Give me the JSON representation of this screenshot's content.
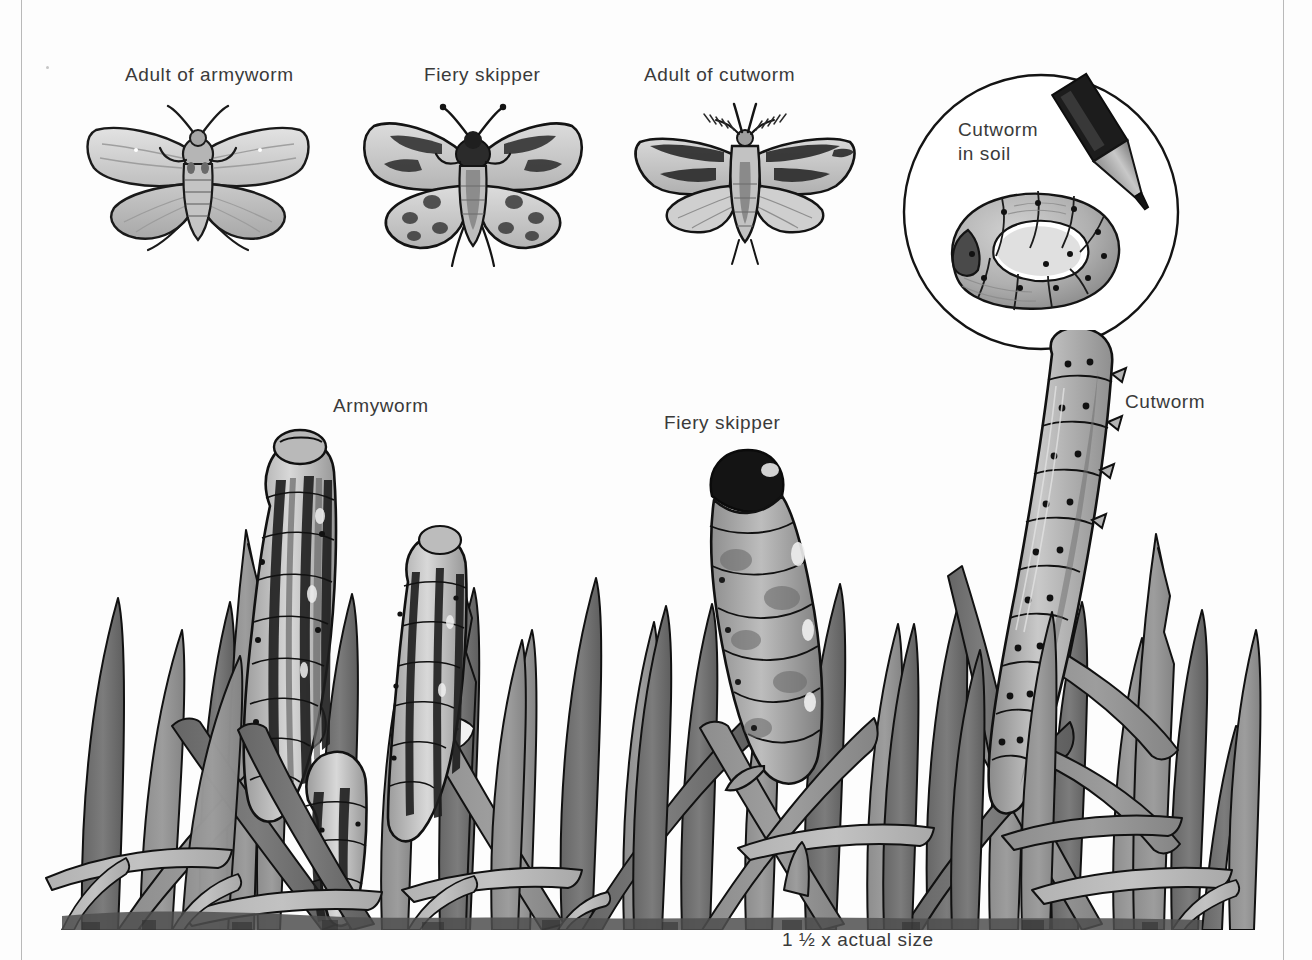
{
  "plate": {
    "title": "Lawn caterpillar pests",
    "background_color": "#fdfdfd",
    "text_color": "#3a3a3a",
    "rule_color": "#b9b9b9",
    "ink_color": "#111111",
    "grass_tone_dark": "#6f6f6f",
    "grass_tone_mid": "#8d8d8d",
    "grass_tone_light": "#b3b3b3",
    "grass_tone_pale": "#d2d2d2"
  },
  "adults": {
    "armyworm": {
      "label": "Adult of armyworm"
    },
    "fiery_skipper": {
      "label": "Fiery skipper"
    },
    "cutworm": {
      "label": "Adult of cutworm"
    }
  },
  "inset": {
    "label": "Cutworm\nin soil",
    "label_line_1": "Cutworm",
    "label_line_2": "in soil"
  },
  "larvae": {
    "armyworm": {
      "label": "Armyworm"
    },
    "fiery_skipper": {
      "label": "Fiery skipper"
    },
    "cutworm": {
      "label": "Cutworm"
    }
  },
  "caption": {
    "scale": "1 ½ x actual size",
    "scale_number": "1",
    "scale_fraction": "½",
    "scale_suffix": "x actual size"
  }
}
